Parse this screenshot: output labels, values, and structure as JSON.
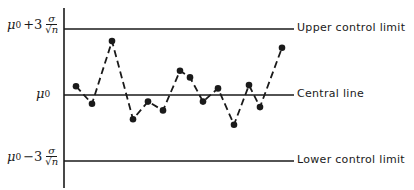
{
  "chart_data": {
    "type": "line",
    "title": "",
    "xlabel": "",
    "ylabel": "",
    "grid": false,
    "units": "sigma/sqrt(n) from mu0",
    "x": [
      1,
      2,
      3,
      4,
      5,
      6,
      7,
      8,
      9,
      10,
      11,
      12,
      13,
      14
    ],
    "series": [
      {
        "name": "sample means",
        "style": "dashed with dot markers",
        "values": [
          0.4,
          -0.4,
          2.45,
          -1.1,
          -0.3,
          -0.7,
          1.1,
          0.8,
          -0.3,
          0.3,
          -1.35,
          0.45,
          -0.55,
          2.15
        ]
      }
    ],
    "reference_lines": [
      {
        "name": "Upper control limit",
        "value": 3,
        "axis_label": "μ0 + 3 σ/√n"
      },
      {
        "name": "Central line",
        "value": 0,
        "axis_label": "μ0"
      },
      {
        "name": "Lower control limit",
        "value": -3,
        "axis_label": "μ0 − 3 σ/√n"
      }
    ],
    "ylim": [
      -4,
      4
    ],
    "legend": "none (lines labeled inline at right)"
  },
  "labels": {
    "ucl": "Upper control limit",
    "cl": "Central line",
    "lcl": "Lower control limit",
    "mu": "μ",
    "sub0": "0",
    "plus3": "+3",
    "minus3": "−3",
    "sigma": "σ",
    "sqrtn": "√n"
  },
  "colors": {
    "ink": "#1a1a1a",
    "background": "#ffffff"
  }
}
